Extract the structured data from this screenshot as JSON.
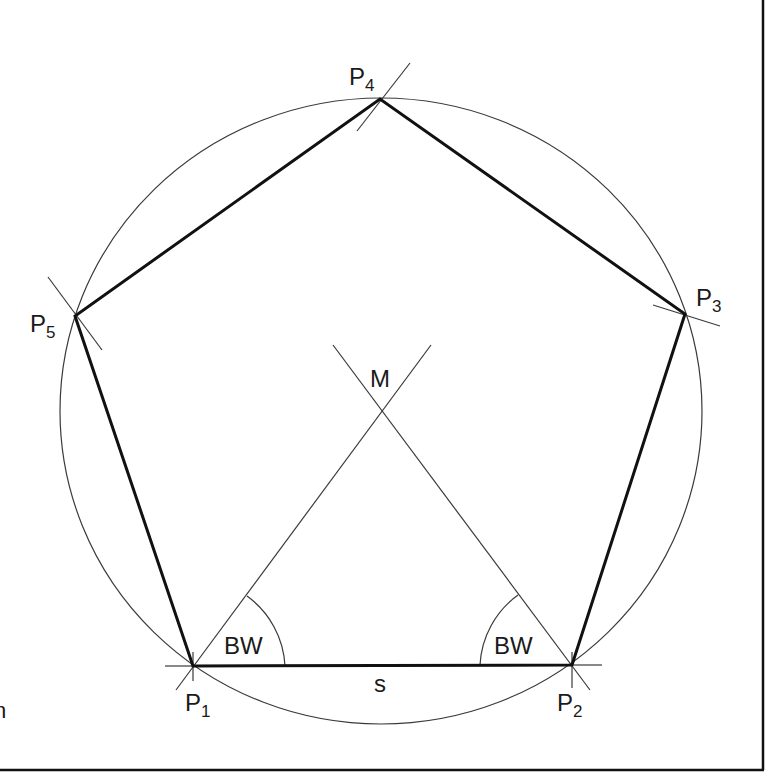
{
  "diagram": {
    "colors": {
      "line": "#111111",
      "construction": "#3a3a3a",
      "background": "#ffffff"
    },
    "vertices": [
      {
        "id": "P1",
        "label_main": "P",
        "label_sub": "1",
        "x": 193,
        "y": 666
      },
      {
        "id": "P2",
        "label_main": "P",
        "label_sub": "2",
        "x": 572,
        "y": 665
      },
      {
        "id": "P3",
        "label_main": "P",
        "label_sub": "3",
        "x": 685,
        "y": 314
      },
      {
        "id": "P4",
        "label_main": "P",
        "label_sub": "4",
        "x": 380,
        "y": 99
      },
      {
        "id": "P5",
        "label_main": "P",
        "label_sub": "5",
        "x": 75,
        "y": 316
      }
    ],
    "center": {
      "label": "M",
      "x": 381,
      "y": 411
    },
    "side_label": "s",
    "angle_labels": [
      "BW",
      "BW"
    ],
    "edge_marker": "n"
  }
}
